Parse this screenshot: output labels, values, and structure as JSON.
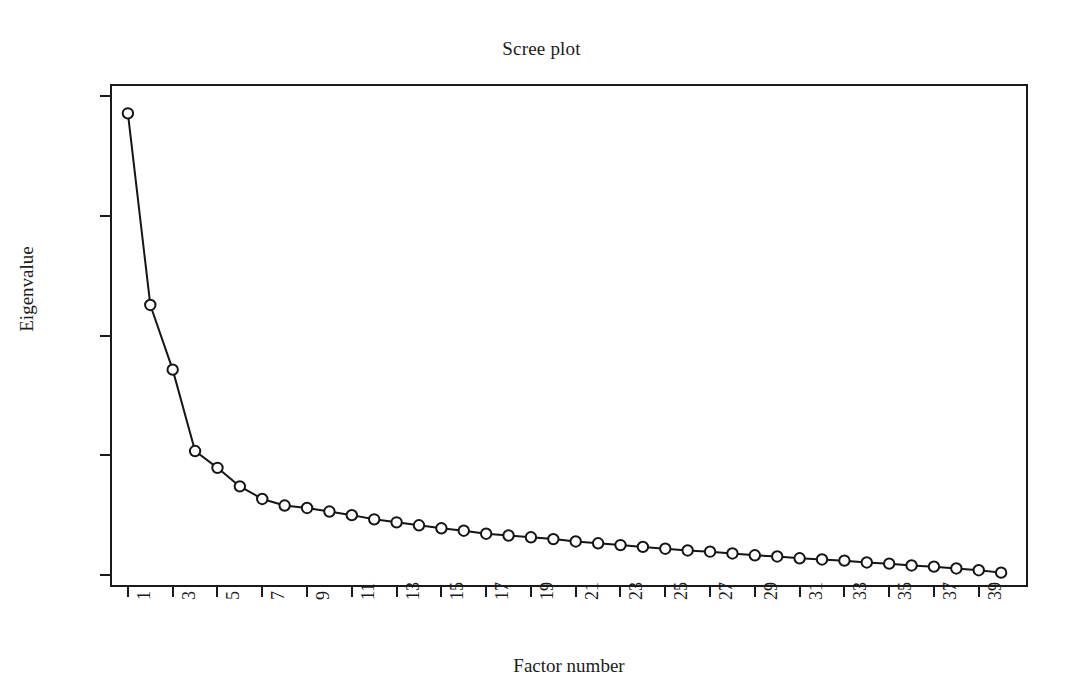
{
  "chart_data": {
    "type": "line",
    "title": "Scree plot",
    "xlabel": "Factor number",
    "ylabel": "Eigenvalue",
    "xlim": [
      0.2,
      41.2
    ],
    "ylim": [
      -0.2,
      8.2
    ],
    "grid": false,
    "legend": null,
    "marker": "open-circle",
    "line_color": "#151515",
    "marker_face_color": "#ffffff",
    "marker_edge_color": "#151515",
    "y_ticks": [
      0,
      2,
      4,
      6,
      8
    ],
    "y_tick_labels": [
      "0",
      "2",
      "4",
      "6",
      "8"
    ],
    "x_ticks": [
      1,
      3,
      5,
      7,
      9,
      11,
      13,
      15,
      17,
      19,
      21,
      23,
      25,
      27,
      29,
      31,
      33,
      35,
      37,
      39
    ],
    "x_tick_labels": [
      "1",
      "3",
      "5",
      "7",
      "9",
      "11",
      "13",
      "15",
      "17",
      "19",
      "21",
      "23",
      "25",
      "27",
      "29",
      "31",
      "33",
      "35",
      "37",
      "39"
    ],
    "x_tick_label_rotation": -90,
    "x": [
      1,
      2,
      3,
      4,
      5,
      6,
      7,
      8,
      9,
      10,
      11,
      12,
      13,
      14,
      15,
      16,
      17,
      18,
      19,
      20,
      21,
      22,
      23,
      24,
      25,
      26,
      27,
      28,
      29,
      30,
      31,
      32,
      33,
      34,
      35,
      36,
      37,
      38,
      39,
      40
    ],
    "y": [
      7.71,
      4.51,
      3.43,
      2.07,
      1.79,
      1.48,
      1.27,
      1.16,
      1.12,
      1.06,
      1.0,
      0.93,
      0.88,
      0.83,
      0.78,
      0.74,
      0.69,
      0.66,
      0.63,
      0.6,
      0.56,
      0.53,
      0.5,
      0.47,
      0.44,
      0.41,
      0.39,
      0.36,
      0.33,
      0.31,
      0.28,
      0.26,
      0.24,
      0.21,
      0.19,
      0.16,
      0.14,
      0.11,
      0.08,
      0.04
    ],
    "series": [
      {
        "name": "Eigenvalue",
        "values": [
          7.71,
          4.51,
          3.43,
          2.07,
          1.79,
          1.48,
          1.27,
          1.16,
          1.12,
          1.06,
          1.0,
          0.93,
          0.88,
          0.83,
          0.78,
          0.74,
          0.69,
          0.66,
          0.63,
          0.6,
          0.56,
          0.53,
          0.5,
          0.47,
          0.44,
          0.41,
          0.39,
          0.36,
          0.33,
          0.31,
          0.28,
          0.26,
          0.24,
          0.21,
          0.19,
          0.16,
          0.14,
          0.11,
          0.08,
          0.04
        ]
      }
    ]
  }
}
